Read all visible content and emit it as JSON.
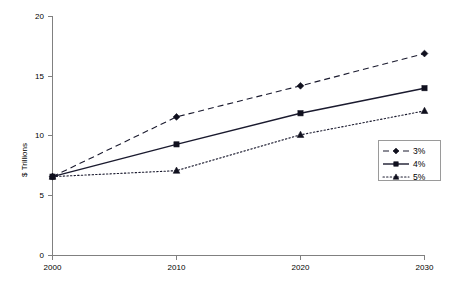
{
  "chart_data": {
    "type": "line",
    "title": "",
    "subtitle": "",
    "xlabel": "",
    "ylabel": "$ Trillions",
    "x": [
      2000,
      2010,
      2020,
      2030
    ],
    "categories": [
      "2000",
      "2010",
      "2020",
      "2030"
    ],
    "xticklabels": [
      "2000",
      "2010",
      "2020",
      "2030"
    ],
    "yticklabels": [
      "0",
      "5",
      "10",
      "15",
      "20"
    ],
    "yticks": [
      0,
      5,
      10,
      15,
      20
    ],
    "xlim": [
      2000,
      2030
    ],
    "ylim": [
      0,
      20
    ],
    "grid": false,
    "legend_position": "right",
    "series": [
      {
        "name": "3%",
        "values": [
          6.6,
          11.6,
          14.2,
          16.9
        ],
        "linestyle": "dashed",
        "marker": "diamond",
        "color": "#10101e"
      },
      {
        "name": "4%",
        "values": [
          6.6,
          9.3,
          11.9,
          14.0
        ],
        "linestyle": "solid",
        "marker": "square",
        "color": "#10101e"
      },
      {
        "name": "5%",
        "values": [
          6.6,
          7.1,
          10.1,
          12.1
        ],
        "linestyle": "dotted",
        "marker": "triangle",
        "color": "#10101e"
      }
    ]
  },
  "axis": {
    "y_title": "$ Trillions",
    "y_labels": [
      "20",
      "15",
      "10",
      "5",
      "0"
    ],
    "x_labels": [
      "2000",
      "2010",
      "2020",
      "2030"
    ]
  },
  "legend": {
    "items": [
      {
        "label": "3%"
      },
      {
        "label": "4%"
      },
      {
        "label": "5%"
      }
    ]
  }
}
